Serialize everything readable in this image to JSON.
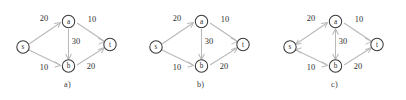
{
  "figure": {
    "node_labels": {
      "source": "s",
      "upper": "a",
      "lower": "b",
      "sink": "t"
    },
    "panels": [
      {
        "id": "a",
        "caption": "a)",
        "edges": [
          {
            "name": "s-a",
            "weight": "20",
            "from": "s",
            "to": "a",
            "direction": "forward"
          },
          {
            "name": "a-t",
            "weight": "10",
            "from": "a",
            "to": "t",
            "direction": "forward"
          },
          {
            "name": "a-b",
            "weight": "30",
            "from": "a",
            "to": "b",
            "direction": "forward"
          },
          {
            "name": "s-b",
            "weight": "10",
            "from": "s",
            "to": "b",
            "direction": "forward"
          },
          {
            "name": "b-t",
            "weight": "20",
            "from": "b",
            "to": "t",
            "direction": "forward"
          }
        ]
      },
      {
        "id": "b",
        "caption": "b)",
        "edges": [
          {
            "name": "s-a",
            "weight": "20",
            "from": "s",
            "to": "a",
            "direction": "forward"
          },
          {
            "name": "a-t",
            "weight": "10",
            "from": "a",
            "to": "t",
            "direction": "forward"
          },
          {
            "name": "a-b",
            "weight": "30",
            "from": "a",
            "to": "b",
            "direction": "forward"
          },
          {
            "name": "s-b",
            "weight": "10",
            "from": "s",
            "to": "b",
            "direction": "forward"
          },
          {
            "name": "b-t",
            "weight": "20",
            "from": "b",
            "to": "t",
            "direction": "forward"
          }
        ]
      },
      {
        "id": "c",
        "caption": "c)",
        "edges": [
          {
            "name": "s-a",
            "weight": "20",
            "from": "s",
            "to": "a",
            "direction": "backward"
          },
          {
            "name": "a-t",
            "weight": "10",
            "from": "a",
            "to": "t",
            "direction": "forward"
          },
          {
            "name": "a-b",
            "weight": "30",
            "from": "a",
            "to": "b",
            "direction": "both"
          },
          {
            "name": "s-b",
            "weight": "10",
            "from": "s",
            "to": "b",
            "direction": "backward"
          },
          {
            "name": "b-t",
            "weight": "20",
            "from": "b",
            "to": "t",
            "direction": "forward"
          }
        ]
      }
    ],
    "colors": {
      "edge": "#b9b9b9",
      "node_stroke": "#3a3a3a",
      "text": "#2b2b2b",
      "background": "#ffffff"
    }
  }
}
